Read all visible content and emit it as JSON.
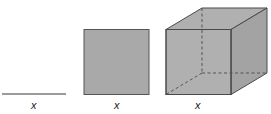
{
  "diagram": {
    "colors": {
      "fill": "#a9a9a9",
      "fill_side": "#a3a3a3",
      "fill_top": "#b0b0b0",
      "edge": "#4a4a4a",
      "hidden_edge": "#555555",
      "line": "#7a7a7a"
    },
    "figures": [
      {
        "id": "line",
        "shape": "line segment",
        "dimension": 1,
        "label": "x"
      },
      {
        "id": "square",
        "shape": "square",
        "dimension": 2,
        "label": "x"
      },
      {
        "id": "cube",
        "shape": "cube",
        "dimension": 3,
        "label": "x"
      }
    ]
  }
}
